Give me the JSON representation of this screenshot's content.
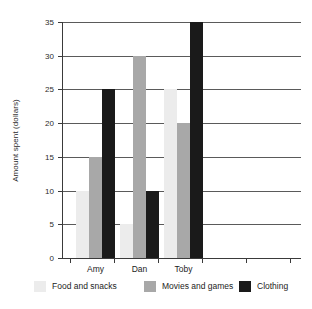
{
  "chart_data": {
    "type": "bar",
    "title": "",
    "subtitle": "",
    "xlabel": "",
    "ylabel": "Amount spent (dollars)",
    "categories": [
      "Amy",
      "Dan",
      "Toby"
    ],
    "series": [
      {
        "name": "Food and snacks",
        "color": "#ececec",
        "values": [
          10,
          5,
          25
        ]
      },
      {
        "name": "Movies and games",
        "color": "#a8a8a8",
        "values": [
          15,
          30,
          20
        ]
      },
      {
        "name": "Clothing",
        "color": "#1a1a1a",
        "values": [
          25,
          10,
          35
        ]
      }
    ],
    "ylim": [
      0,
      35
    ],
    "ytick_values": [
      0,
      5,
      10,
      15,
      20,
      25,
      30,
      35
    ],
    "ytick_labels": [
      "0",
      "5",
      "10",
      "15",
      "20",
      "25",
      "30",
      "35"
    ],
    "grid": "horizontal",
    "legend_position": "bottom"
  },
  "axis": {
    "y_title": "Amount spent (dollars)",
    "y_ticks": [
      {
        "label": "35",
        "value": 35
      },
      {
        "label": "30",
        "value": 30
      },
      {
        "label": "25",
        "value": 25
      },
      {
        "label": "20",
        "value": 20
      },
      {
        "label": "15",
        "value": 15
      },
      {
        "label": "10",
        "value": 10
      },
      {
        "label": "5",
        "value": 5
      },
      {
        "label": "0",
        "value": 0
      }
    ],
    "x_labels": [
      "Amy",
      "Dan",
      "Toby"
    ]
  },
  "legend": {
    "items": [
      {
        "label": "Food and snacks",
        "color": "#ececec"
      },
      {
        "label": "Movies and games",
        "color": "#a8a8a8"
      },
      {
        "label": "Clothing",
        "color": "#1a1a1a"
      }
    ]
  }
}
